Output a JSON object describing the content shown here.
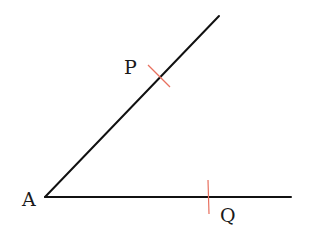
{
  "diagram": {
    "type": "geometric-angle-construction",
    "colors": {
      "line": "#111111",
      "arc_mark": "#e8705f",
      "label": "#1a1a1a",
      "background": "#ffffff"
    },
    "vertex": {
      "label": "A",
      "x": 45,
      "y": 197
    },
    "rays": [
      {
        "name": "upper-ray",
        "from": [
          45,
          197
        ],
        "to": [
          219,
          16
        ]
      },
      {
        "name": "horizontal-ray",
        "from": [
          45,
          197
        ],
        "to": [
          291,
          197
        ]
      }
    ],
    "points": [
      {
        "label": "P",
        "x": 161,
        "y": 77,
        "on": "upper-ray"
      },
      {
        "label": "Q",
        "x": 208,
        "y": 197,
        "on": "horizontal-ray"
      }
    ],
    "labels": {
      "A": "A",
      "P": "P",
      "Q": "Q"
    }
  }
}
